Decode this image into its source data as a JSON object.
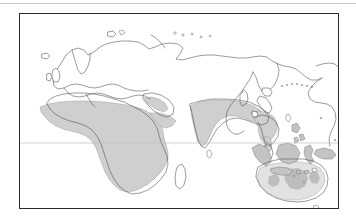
{
  "page": {
    "background_color": "#ffffff",
    "width": 356,
    "height": 224,
    "top_rule_color": "#c9c9c9"
  },
  "figure": {
    "caption": "",
    "frame_color": "#2a2a2a",
    "frame": {
      "x": 19,
      "y": 13,
      "width": 320,
      "height": 196
    }
  },
  "map": {
    "title": "",
    "projection_note": "",
    "center_hemisphere": "Eastern Hemisphere",
    "coastline_color": "#4a4a4a",
    "ocean_color": "#ffffff",
    "land_color": "#ffffff",
    "gridlines": {
      "equator_visible": true,
      "equator_color": "#bdbdbd",
      "equator_label": ""
    },
    "legend": {
      "visible": false,
      "entries": [
        {
          "label": "",
          "color": "#cfcfcf"
        }
      ]
    },
    "range_color": "#cfcfcf",
    "range_color_light": "#e2e2e2",
    "range_color_dark": "#bdbdbd",
    "shaded_regions": [
      {
        "name": "sub-saharan-africa",
        "color": "#cfcfcf"
      },
      {
        "name": "arabian-peninsula-coast",
        "color": "#cfcfcf"
      },
      {
        "name": "south-asia",
        "color": "#cfcfcf"
      },
      {
        "name": "southeast-asia",
        "color": "#cfcfcf"
      },
      {
        "name": "indonesia-philippines",
        "color": "#c4c4c4"
      },
      {
        "name": "new-guinea",
        "color": "#c4c4c4"
      },
      {
        "name": "australia",
        "color": "#e2e2e2"
      }
    ],
    "landmasses": [
      {
        "name": "eurasia"
      },
      {
        "name": "africa"
      },
      {
        "name": "australia"
      },
      {
        "name": "north-america-west"
      },
      {
        "name": "madagascar"
      },
      {
        "name": "new-guinea"
      },
      {
        "name": "japan"
      },
      {
        "name": "new-zealand"
      },
      {
        "name": "british-isles"
      },
      {
        "name": "scandinavia"
      },
      {
        "name": "sri-lanka"
      },
      {
        "name": "philippines"
      },
      {
        "name": "borneo"
      },
      {
        "name": "sumatra"
      },
      {
        "name": "java"
      },
      {
        "name": "sulawesi"
      },
      {
        "name": "taiwan"
      },
      {
        "name": "iceland"
      },
      {
        "name": "svalbard"
      },
      {
        "name": "novaya-zemlya"
      },
      {
        "name": "tasmania"
      }
    ]
  }
}
